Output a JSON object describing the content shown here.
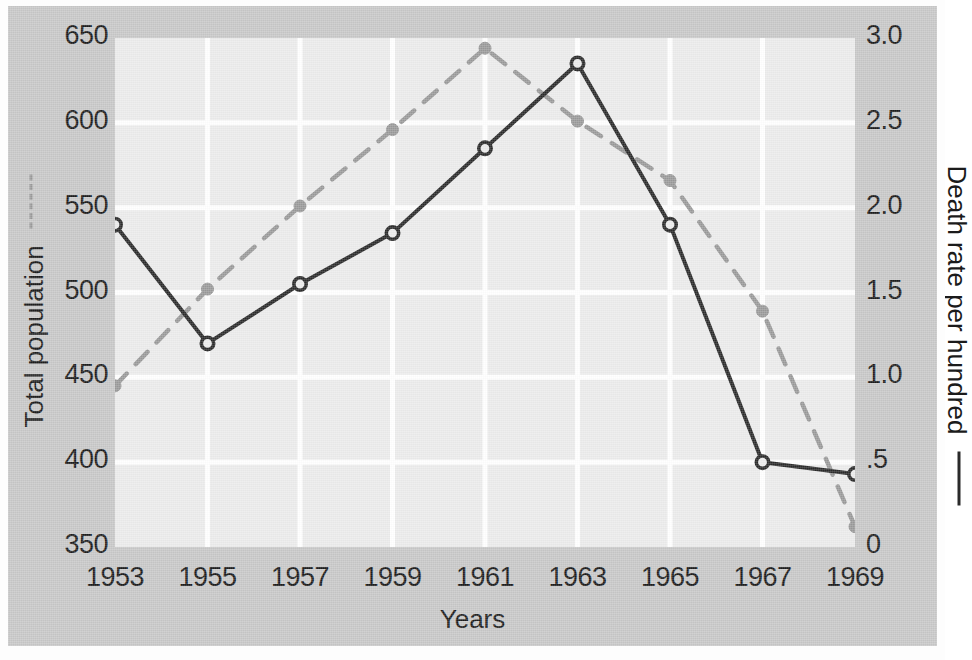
{
  "chart_data": {
    "type": "line",
    "title": "",
    "xlabel": "Years",
    "x": [
      1953,
      1955,
      1957,
      1959,
      1961,
      1963,
      1965,
      1967,
      1969
    ],
    "xtick_labels": [
      "1953",
      "1955",
      "1957",
      "1959",
      "1961",
      "1963",
      "1965",
      "1967",
      "1969"
    ],
    "xlim": [
      1953,
      1969
    ],
    "grid": true,
    "legend_position": "axis-labels",
    "axes": {
      "left": {
        "label": "Total population",
        "ylim": [
          350,
          650
        ],
        "ticks": [
          350,
          400,
          450,
          500,
          550,
          600,
          650
        ],
        "tick_labels": [
          "350",
          "400",
          "450",
          "500",
          "550",
          "600",
          "650"
        ],
        "marker": "dashed-line"
      },
      "right": {
        "label": "Death rate per hundred",
        "ylim": [
          0,
          3.0
        ],
        "ticks": [
          0,
          0.5,
          1.0,
          1.5,
          2.0,
          2.5,
          3.0
        ],
        "tick_labels": [
          "0",
          ".5",
          "1.0",
          "1.5",
          "2.0",
          "2.5",
          "3.0"
        ],
        "marker": "solid-line"
      }
    },
    "series": [
      {
        "name": "Total population",
        "axis": "left",
        "style": "dashed",
        "color": "#9a9a9a",
        "marker": "filled-circle",
        "values": [
          445,
          502,
          551,
          596,
          644,
          601,
          566,
          489,
          362
        ]
      },
      {
        "name": "Death rate per hundred",
        "axis": "right",
        "style": "solid",
        "color": "#2a2a2a",
        "marker": "open-circle",
        "values": [
          1.9,
          1.2,
          1.55,
          1.85,
          2.35,
          2.85,
          1.9,
          0.5,
          0.43
        ]
      }
    ],
    "colors": {
      "panel_background": "#ececec",
      "figure_background": "#c8c8c8",
      "gridline": "#ffffff",
      "population_line": "#9a9a9a",
      "death_rate_line": "#2a2a2a",
      "text": "#1b1b1b"
    }
  }
}
